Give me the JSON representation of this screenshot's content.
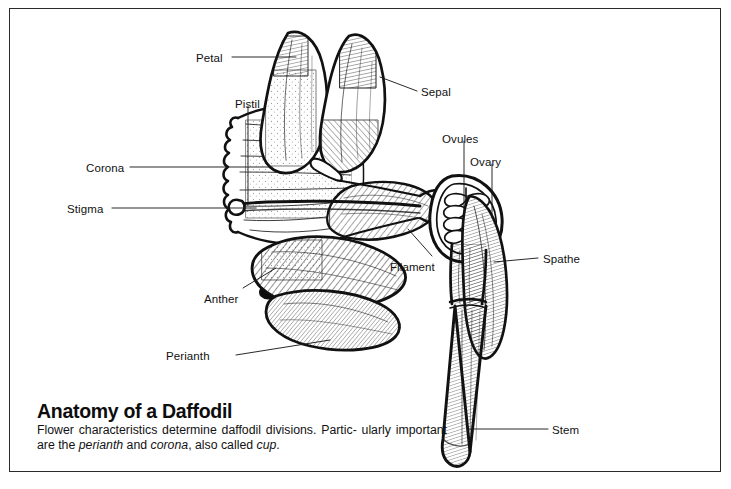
{
  "figure": {
    "title": "Anatomy of a Daffodil",
    "caption_line1": "Flower characteristics determine daffodil divisions. Partic-",
    "caption_line2_a": "ularly important are the ",
    "caption_line2_i1": "perianth",
    "caption_line2_b": " and ",
    "caption_line2_i2": "corona",
    "caption_line2_c": ", also called",
    "caption_line3_i": "cup",
    "caption_line3_end": ".",
    "background_color": "#ffffff",
    "ink_color": "#111111",
    "frame_color": "#2b2b2b"
  },
  "labels": [
    {
      "id": "petal",
      "text": "Petal",
      "x": 196,
      "y": 52,
      "side": "left"
    },
    {
      "id": "pistil",
      "text": "Pistil",
      "x": 235,
      "y": 98,
      "side": "top"
    },
    {
      "id": "corona",
      "text": "Corona",
      "x": 86,
      "y": 162,
      "side": "left"
    },
    {
      "id": "stigma",
      "text": "Stigma",
      "x": 67,
      "y": 203,
      "side": "left"
    },
    {
      "id": "anther",
      "text": "Anther",
      "x": 204,
      "y": 293,
      "side": "left"
    },
    {
      "id": "perianth",
      "text": "Perianth",
      "x": 166,
      "y": 350,
      "side": "left"
    },
    {
      "id": "sepal",
      "text": "Sepal",
      "x": 421,
      "y": 86,
      "side": "right"
    },
    {
      "id": "ovules",
      "text": "Ovules",
      "x": 442,
      "y": 133,
      "side": "top"
    },
    {
      "id": "ovary",
      "text": "Ovary",
      "x": 470,
      "y": 156,
      "side": "top"
    },
    {
      "id": "filament",
      "text": "Filament",
      "x": 390,
      "y": 261,
      "side": "right"
    },
    {
      "id": "spathe",
      "text": "Spathe",
      "x": 543,
      "y": 253,
      "side": "right"
    },
    {
      "id": "stem",
      "text": "Stem",
      "x": 552,
      "y": 424,
      "side": "right"
    }
  ],
  "parts": [
    "petal",
    "sepal",
    "pistil",
    "stigma",
    "corona",
    "anther",
    "filament",
    "perianth",
    "ovules",
    "ovary",
    "spathe",
    "stem"
  ]
}
